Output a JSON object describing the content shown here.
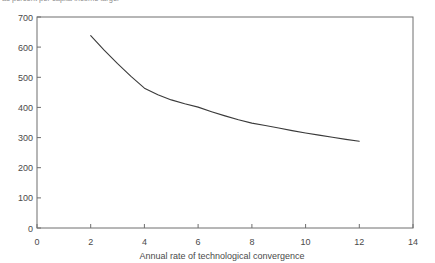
{
  "top_caption": "as percent per capita income larger",
  "chart_data": {
    "type": "line",
    "title": "",
    "subtitle": "",
    "xlabel": "Annual rate of technological convergence",
    "ylabel": "",
    "xlim": [
      0,
      14
    ],
    "ylim": [
      0,
      700
    ],
    "xticks": [
      0,
      2,
      4,
      6,
      8,
      10,
      12,
      14
    ],
    "xtick_labels": [
      "0",
      "2",
      "4",
      "6",
      "8",
      "10",
      "12",
      "14"
    ],
    "yticks": [
      0,
      100,
      200,
      300,
      400,
      500,
      600,
      700
    ],
    "ytick_labels": [
      "0",
      "100",
      "200",
      "300",
      "400",
      "500",
      "600",
      "700"
    ],
    "grid": false,
    "legend": null,
    "series": [
      {
        "name": "years to convergence",
        "color": "#3a3a3a",
        "x": [
          2,
          2.5,
          3,
          3.5,
          4,
          4.5,
          5,
          5.5,
          6,
          6.5,
          7,
          7.5,
          8,
          8.5,
          9,
          9.5,
          10,
          10.5,
          11,
          11.5,
          12
        ],
        "values": [
          638,
          590,
          545,
          503,
          464,
          442,
          425,
          412,
          401,
          386,
          372,
          359,
          348,
          340,
          332,
          323,
          315,
          308,
          301,
          294,
          288
        ]
      }
    ],
    "annotations": []
  },
  "axes": {
    "frame_color": "#6e6e6e",
    "line_color": "#3a3a3a",
    "background": "#ffffff"
  }
}
